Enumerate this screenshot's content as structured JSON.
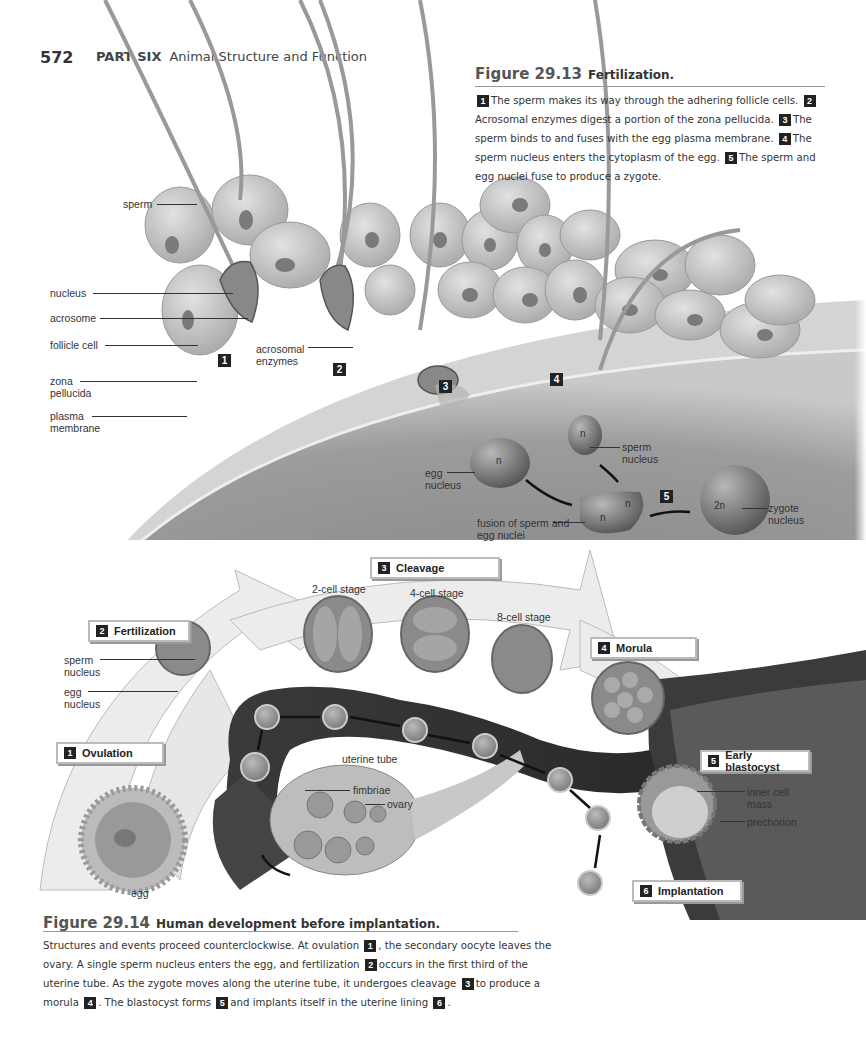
{
  "header": {
    "page_number": "572",
    "part_label": "PART SIX",
    "part_title": "Animal Structure and Function"
  },
  "figure_29_13": {
    "number": "Figure 29.13",
    "title": "Fertilization.",
    "caption": [
      {
        "step": "1",
        "text": "The sperm makes its way through the adhering follicle cells."
      },
      {
        "step": "2",
        "text": "Acrosomal enzymes digest a portion of the zona pellucida."
      },
      {
        "step": "3",
        "text": "The sperm binds to and fuses with the egg plasma membrane."
      },
      {
        "step": "4",
        "text": "The sperm nucleus enters the cytoplasm of the egg."
      },
      {
        "step": "5",
        "text": "The sperm and egg nuclei fuse to produce a zygote."
      }
    ],
    "labels": {
      "sperm": "sperm",
      "nucleus": "nucleus",
      "acrosome": "acrosome",
      "follicle_cell": "follicle cell",
      "zona_pellucida": "zona pellucida",
      "plasma_membrane": "plasma membrane",
      "acrosomal_enzymes": "acrosomal enzymes",
      "egg_nucleus": "egg nucleus",
      "sperm_nucleus": "sperm nucleus",
      "fusion": "fusion of sperm and egg nuclei",
      "zygote_nucleus": "zygote nucleus",
      "n": "n",
      "two_n": "2n"
    },
    "markers": [
      "1",
      "2",
      "3",
      "4",
      "5"
    ]
  },
  "figure_29_14": {
    "number": "Figure 29.14",
    "title": "Human development before implantation.",
    "steps": [
      {
        "num": "1",
        "label": "Ovulation"
      },
      {
        "num": "2",
        "label": "Fertilization"
      },
      {
        "num": "3",
        "label": "Cleavage"
      },
      {
        "num": "4",
        "label": "Morula"
      },
      {
        "num": "5",
        "label": "Early blastocyst"
      },
      {
        "num": "6",
        "label": "Implantation"
      }
    ],
    "labels": {
      "two_cell": "2-cell stage",
      "four_cell": "4-cell stage",
      "eight_cell": "8-cell stage",
      "sperm_nucleus": "sperm nucleus",
      "egg_nucleus": "egg nucleus",
      "uterine_tube": "uterine tube",
      "fimbriae": "fimbriae",
      "ovary": "ovary",
      "egg": "egg",
      "inner_cell_mass": "inner cell mass",
      "prechorion": "prechorion"
    },
    "caption": {
      "p1": "Structures and events proceed counterclockwise. At ovulation",
      "p2": ", the secondary oocyte leaves the ovary. A single sperm nucleus enters the egg, and fertilization",
      "p3": "occurs in the first third of the uterine tube. As the zygote moves along the uterine tube, it undergoes cleavage",
      "p4": "to produce a morula",
      "p5": ". The blastocyst forms",
      "p6": "and implants itself in the uterine lining",
      "p7": "."
    }
  }
}
